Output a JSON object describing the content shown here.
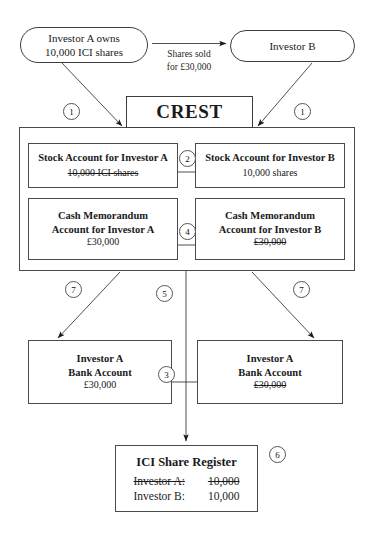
{
  "diagram": {
    "investor_a_oval": {
      "line1": "Investor A owns",
      "line2": "10,000 ICI shares"
    },
    "investor_b_oval": {
      "label": "Investor B"
    },
    "sale_label": {
      "line1": "Shares sold",
      "line2": "for £30,000"
    },
    "crest": {
      "label": "CREST"
    },
    "stock_account_a": {
      "title": "Stock Account for Investor A",
      "amount": "10,000 ICI shares",
      "struck": true
    },
    "stock_account_b": {
      "title": "Stock Account for Investor B",
      "amount": "10,000 shares",
      "struck": false
    },
    "cash_memo_a": {
      "line1": "Cash Memorandum",
      "line2": "Account for Investor A",
      "amount": "£30,000",
      "struck": false
    },
    "cash_memo_b": {
      "line1": "Cash Memorandum",
      "line2": "Account for Investor B",
      "amount": "£30,000",
      "struck": true
    },
    "bank_left": {
      "line1": "Investor A",
      "line2": "Bank Account",
      "amount": "£30,000",
      "struck": false
    },
    "bank_right": {
      "line1": "Investor A",
      "line2": "Bank Account",
      "amount": "£30,000",
      "struck": true
    },
    "register": {
      "title": "ICI Share Register",
      "rows": [
        {
          "name": "Investor A:",
          "shares": "10,000",
          "struck": true
        },
        {
          "name": "Investor B:",
          "shares": "10,000",
          "struck": false
        }
      ]
    },
    "step_markers": [
      {
        "id": "step-1-left",
        "number": "1"
      },
      {
        "id": "step-1-right",
        "number": "1"
      },
      {
        "id": "step-2",
        "number": "2"
      },
      {
        "id": "step-4",
        "number": "4"
      },
      {
        "id": "step-7-left",
        "number": "7"
      },
      {
        "id": "step-5",
        "number": "5"
      },
      {
        "id": "step-7-right",
        "number": "7"
      },
      {
        "id": "step-3",
        "number": "3"
      },
      {
        "id": "step-6",
        "number": "6"
      }
    ],
    "colors": {
      "stroke": "#3c3c3c",
      "box_stroke": "#4a4a4a",
      "text": "#1a1a1a",
      "background": "#ffffff"
    }
  }
}
